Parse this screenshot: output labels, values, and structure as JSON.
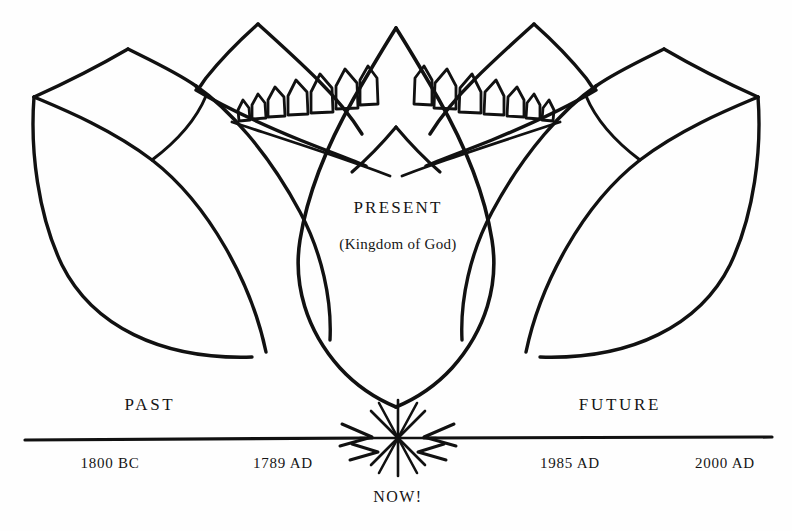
{
  "figure": {
    "kind": "hand-drawn-lotus-timeline-diagram",
    "ink_color": "#111111",
    "background_color": "#ffffff"
  },
  "center_petal": {
    "title": "PRESENT",
    "subtitle": "(Kingdom of God)"
  },
  "timeline": {
    "left_era_label": "PAST",
    "right_era_label": "FUTURE",
    "now_label": "NOW!",
    "marks": [
      {
        "label": "1800 BC",
        "x": 110
      },
      {
        "label": "1789 AD",
        "x": 283
      },
      {
        "label": "1985 AD",
        "x": 570
      },
      {
        "label": "2000 AD",
        "x": 725
      }
    ]
  }
}
